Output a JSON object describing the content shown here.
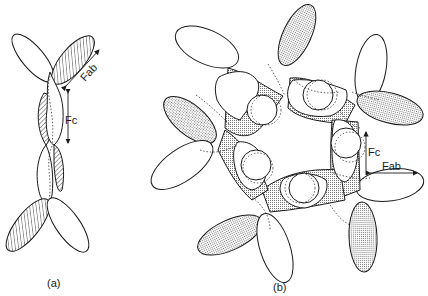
{
  "figure": {
    "panels": [
      {
        "id": "a",
        "caption": "(a)",
        "fill_style": "hatched",
        "labels": {
          "fab": "Fab",
          "fc": "Fc"
        }
      },
      {
        "id": "b",
        "caption": "(b)",
        "fill_style": "dotted",
        "labels": {
          "fab": "Fab",
          "fc": "Fc"
        }
      }
    ],
    "colors": {
      "stroke": "#1a1a1a",
      "background": "#ffffff",
      "pattern": "#555555"
    }
  }
}
